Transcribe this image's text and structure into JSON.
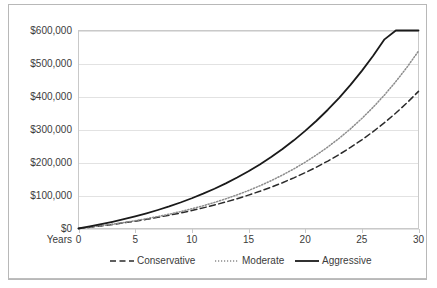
{
  "chart_data": {
    "type": "line",
    "title": "",
    "xlabel": "Years",
    "ylabel": "",
    "grid": true,
    "legend_position": "bottom",
    "x": [
      0,
      1,
      2,
      3,
      4,
      5,
      6,
      7,
      8,
      9,
      10,
      11,
      12,
      13,
      14,
      15,
      16,
      17,
      18,
      19,
      20,
      21,
      22,
      23,
      24,
      25,
      26,
      27,
      28,
      29,
      30
    ],
    "xlim": [
      0,
      30
    ],
    "ylim": [
      0,
      600000
    ],
    "xticks": [
      "0",
      "5",
      "10",
      "15",
      "20",
      "25",
      "30"
    ],
    "xtick_values": [
      0,
      5,
      10,
      15,
      20,
      25,
      30
    ],
    "yticks": [
      "$0",
      "$100,000",
      "$200,000",
      "$300,000",
      "$400,000",
      "$500,000",
      "$600,000"
    ],
    "ytick_values": [
      0,
      100000,
      200000,
      300000,
      400000,
      500000,
      600000
    ],
    "series": [
      {
        "name": "Conservative",
        "style": "dashed",
        "color": "#2b2b2b",
        "width": 1.5,
        "values": [
          5000,
          9800,
          14900,
          20300,
          26000,
          32100,
          38500,
          45300,
          52600,
          60200,
          68400,
          77000,
          86200,
          95900,
          106200,
          117100,
          128700,
          140900,
          153900,
          167600,
          182200,
          197600,
          213900,
          231200,
          249500,
          268900,
          289400,
          311100,
          334100,
          358400,
          384200
        ]
      },
      {
        "name": "Moderate",
        "style": "dotted",
        "color": "#8c8c8c",
        "width": 1.5,
        "values": [
          5000,
          10200,
          15800,
          21800,
          28300,
          35300,
          42800,
          50900,
          59600,
          69000,
          79100,
          90000,
          101700,
          114300,
          127900,
          142500,
          158200,
          175100,
          193300,
          212900,
          234000,
          256700,
          281100,
          307400,
          335700,
          366200,
          399000,
          434300,
          472300,
          513200,
          557200
        ]
      },
      {
        "name": "Aggressive",
        "style": "solid",
        "color": "#1a1a1a",
        "width": 1.8,
        "values": [
          5000,
          10600,
          16800,
          23700,
          31300,
          39700,
          49000,
          59300,
          70700,
          83300,
          97200,
          112600,
          129600,
          148400,
          169200,
          192100,
          217400,
          245300,
          276100,
          310100,
          347600,
          389000,
          434600,
          484900,
          540400,
          601600,
          669100,
          743500,
          825600,
          916100,
          1015800
        ]
      }
    ],
    "series_display": [
      {
        "name": "Conservative",
        "style": "dashed",
        "endpoint_value": 225000
      },
      {
        "name": "Moderate",
        "style": "dotted",
        "endpoint_value": 370000
      },
      {
        "name": "Aggressive",
        "style": "solid",
        "endpoint_value": 580000
      }
    ],
    "plotted": {
      "Conservative": [
        0,
        3800,
        7900,
        12300,
        17100,
        22300,
        27800,
        33800,
        40200,
        47100,
        54500,
        62500,
        71100,
        80400,
        90400,
        101200,
        112800,
        125300,
        138800,
        153400,
        169100,
        186100,
        204400,
        224200,
        245600,
        268700,
        293700,
        320700,
        349900,
        381400,
        415500
      ],
      "Moderate": [
        0,
        4000,
        8300,
        13000,
        18100,
        23700,
        29700,
        36300,
        43400,
        51200,
        59700,
        68900,
        79000,
        90000,
        102000,
        115100,
        129400,
        145000,
        162000,
        180600,
        200900,
        223000,
        247100,
        273400,
        302100,
        333400,
        367500,
        404700,
        445200,
        489400,
        537600
      ],
      "Aggressive": [
        0,
        6200,
        12900,
        20200,
        28100,
        36700,
        46000,
        56100,
        67000,
        78800,
        91600,
        105500,
        120500,
        136800,
        154400,
        173500,
        194200,
        216600,
        240900,
        267200,
        295700,
        326500,
        359900,
        396100,
        435200,
        477600,
        523500,
        573200,
        627000,
        685200,
        748200
      ]
    }
  },
  "legend": {
    "items": [
      {
        "label": "Conservative",
        "style": "dashed"
      },
      {
        "label": "Moderate",
        "style": "dotted"
      },
      {
        "label": "Aggressive",
        "style": "solid"
      }
    ]
  },
  "axis": {
    "x_title": "Years"
  }
}
